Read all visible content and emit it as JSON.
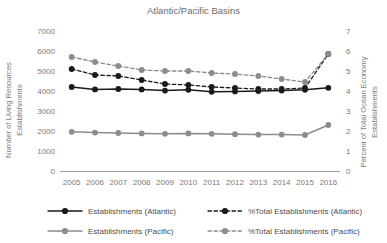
{
  "chart_data": {
    "type": "line",
    "title": "Atlantic/Pacific Basins",
    "xlabel": "",
    "ylabel": "Number of Living Resources Establishments",
    "y2label": "Percent of Total Ocean Economy Establishments",
    "categories": [
      "2005",
      "2006",
      "2007",
      "2008",
      "2009",
      "2010",
      "2011",
      "2012",
      "2013",
      "2014",
      "2015",
      "2016"
    ],
    "ylim": [
      0,
      7000
    ],
    "yticks": [
      0,
      1000,
      2000,
      3000,
      4000,
      5000,
      6000,
      7000
    ],
    "y2lim": [
      0,
      7
    ],
    "y2ticks": [
      0,
      1,
      2,
      3,
      4,
      5,
      6,
      7
    ],
    "grid": false,
    "legend_position": "bottom",
    "series": [
      {
        "name": "Establishments (Atlantic)",
        "axis": "left",
        "style": "solid",
        "color": "#1a1a1a",
        "values": [
          4200,
          4080,
          4100,
          4080,
          4020,
          4060,
          3960,
          3980,
          4000,
          4020,
          4060,
          4160
        ]
      },
      {
        "name": "Establishments (Pacific)",
        "axis": "left",
        "style": "solid",
        "color": "#8c8c8c",
        "values": [
          1960,
          1920,
          1900,
          1880,
          1860,
          1880,
          1860,
          1840,
          1820,
          1820,
          1800,
          2300
        ]
      },
      {
        "name": "%Total Establishments (Atlantic)",
        "axis": "right",
        "style": "dashed",
        "color": "#1a1a1a",
        "values": [
          5.1,
          4.8,
          4.75,
          4.55,
          4.35,
          4.3,
          4.2,
          4.15,
          4.1,
          4.1,
          4.15,
          5.85
        ]
      },
      {
        "name": "%Total Establishments (Pacific)",
        "axis": "right",
        "style": "dashed",
        "color": "#8c8c8c",
        "values": [
          5.7,
          5.45,
          5.25,
          5.05,
          5.0,
          5.0,
          4.9,
          4.85,
          4.75,
          4.6,
          4.45,
          5.85
        ]
      }
    ]
  }
}
